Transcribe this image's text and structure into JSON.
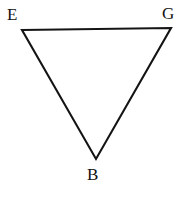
{
  "figure": {
    "name": "inverted-triangle-EGB",
    "background_color": "#ffffff",
    "stroke_color": "#141414",
    "stroke_width": 2.1,
    "fill": "none",
    "width": 186,
    "height": 199
  },
  "labels": {
    "top_left": "E",
    "top_right": "G",
    "bottom": "B"
  },
  "geometry": {
    "type": "triangle",
    "orientation": "inverted",
    "vertices": [
      {
        "label": "E",
        "x": 22,
        "y": 30
      },
      {
        "label": "G",
        "x": 171,
        "y": 28
      },
      {
        "label": "B",
        "x": 96,
        "y": 159
      }
    ],
    "edges": [
      {
        "from": "E",
        "to": "G"
      },
      {
        "from": "G",
        "to": "B"
      },
      {
        "from": "B",
        "to": "E"
      }
    ],
    "label_positions": [
      {
        "label": "E",
        "x": 7,
        "y": 6
      },
      {
        "label": "G",
        "x": 162,
        "y": 5
      },
      {
        "label": "B",
        "x": 87,
        "y": 166
      }
    ]
  }
}
